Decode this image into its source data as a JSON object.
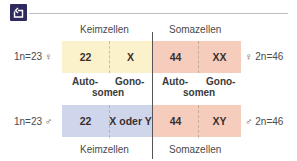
{
  "icon": "back-arrow-icon",
  "colors": {
    "keim_female": "#fbf2cc",
    "soma": "#f6cdbd",
    "keim_male": "#cfd6ec",
    "icon_bg": "#2e2a5e"
  },
  "top": {
    "header_left": "Keimzellen",
    "header_right": "Somazellen",
    "left_label": "1n=23 ♀",
    "right_label": "♀ 2n=46",
    "cells": [
      "22",
      "X",
      "44",
      "XX"
    ]
  },
  "middle": {
    "left": {
      "line1_a": "Auto-",
      "line1_b": "Gono-",
      "line2": "somen"
    },
    "right": {
      "line1_a": "Auto-",
      "line1_b": "Gono-",
      "line2": "somen"
    }
  },
  "bottom": {
    "footer_left": "Keimzellen",
    "footer_right": "Somazellen",
    "left_label": "1n=23 ♂",
    "right_label": "♂ 2n=46",
    "cells": [
      "22",
      "X oder Y",
      "44",
      "XY"
    ]
  }
}
